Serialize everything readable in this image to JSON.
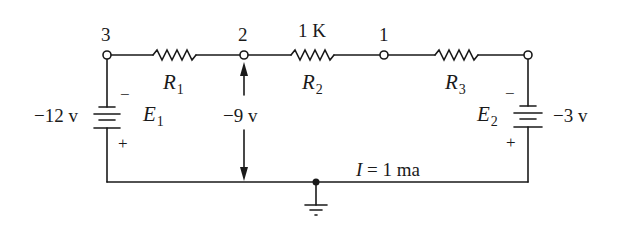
{
  "diagram": {
    "type": "circuit-schematic",
    "stroke_color": "#1a1a1a",
    "background": "#ffffff",
    "nodes": [
      {
        "id": "node-3",
        "label": "3"
      },
      {
        "id": "node-2",
        "label": "2"
      },
      {
        "id": "node-1",
        "label": "1"
      }
    ],
    "resistors": [
      {
        "id": "R1",
        "name": "R",
        "sub": "1",
        "value": ""
      },
      {
        "id": "R2",
        "name": "R",
        "sub": "2",
        "value": "1 K"
      },
      {
        "id": "R3",
        "name": "R",
        "sub": "3",
        "value": ""
      }
    ],
    "batteries": [
      {
        "id": "E1",
        "name": "E",
        "sub": "1",
        "voltage": "−12 v",
        "top_sign": "−",
        "bottom_sign": "+"
      },
      {
        "id": "E2",
        "name": "E",
        "sub": "2",
        "voltage": "−3 v",
        "top_sign": "−",
        "bottom_sign": "+"
      }
    ],
    "measurement": {
      "label": "−9 v",
      "between": [
        "node-2",
        "ground"
      ]
    },
    "current": {
      "label": "I = 1 ma",
      "symbol": "I",
      "text": " = 1 ma"
    },
    "ground": {
      "symbol": "ground-icon"
    }
  }
}
